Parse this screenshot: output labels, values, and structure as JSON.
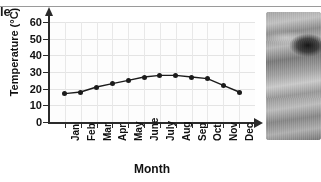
{
  "page": {
    "title_fragment": "le",
    "top_rule": true
  },
  "photo": {
    "name": "sand-dunes-photograph",
    "description": "grayscale photo of desert sand dunes"
  },
  "chart_data": {
    "type": "line",
    "title": "",
    "xlabel": "Month",
    "ylabel": "Temperature (°C)",
    "categories": [
      "Jan",
      "Feb",
      "Mar",
      "Apr",
      "May",
      "June",
      "July",
      "Aug",
      "Sep",
      "Oct",
      "Nov",
      "Dec"
    ],
    "values": [
      17,
      18,
      21,
      23,
      25,
      27,
      28,
      28,
      27,
      26,
      22,
      18
    ],
    "ylim": [
      0,
      60
    ],
    "yticks": [
      0,
      10,
      20,
      30,
      40,
      50,
      60
    ],
    "grid": true,
    "legend": "none",
    "marker": "filled-circle",
    "line_color": "#1b1b1b"
  }
}
